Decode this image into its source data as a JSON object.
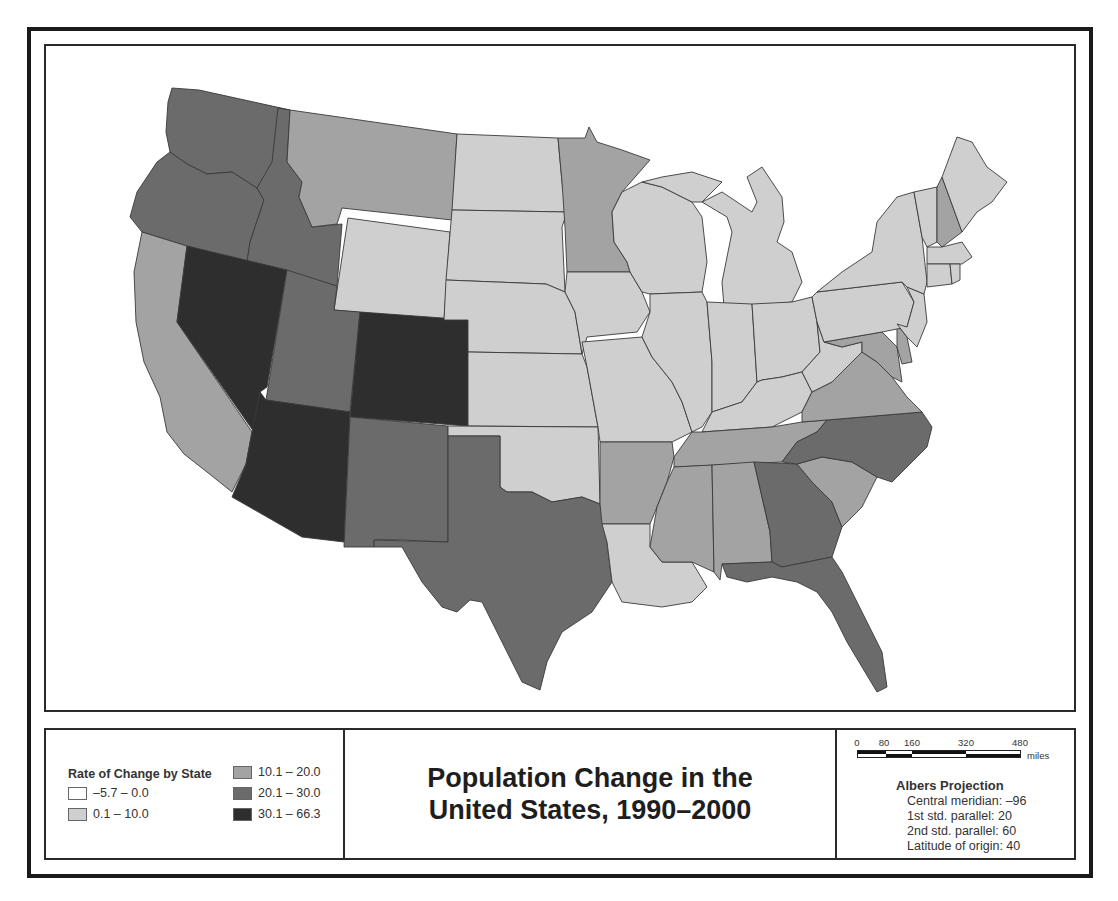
{
  "map": {
    "title_line1": "Population Change in the",
    "title_line2": "United States, 1990–2000",
    "class_colors": {
      "c1": "#ffffff",
      "c2": "#cfcfcf",
      "c3": "#a3a3a3",
      "c4": "#6b6b6b",
      "c5": "#2e2e2e"
    },
    "border_color": "#3a3a3a",
    "states": {
      "WA": "c4",
      "OR": "c4",
      "ID": "c4",
      "MT": "c3",
      "WY": "c2",
      "CA": "c3",
      "NV": "c5",
      "UT": "c4",
      "CO": "c5",
      "AZ": "c5",
      "NM": "c4",
      "TX": "c4",
      "ND": "c2",
      "SD": "c2",
      "NE": "c2",
      "KS": "c2",
      "OK": "c2",
      "MN": "c3",
      "IA": "c2",
      "MO": "c2",
      "AR": "c3",
      "LA": "c2",
      "WI": "c2",
      "IL": "c2",
      "MI": "c2",
      "IN": "c2",
      "OH": "c2",
      "KY": "c2",
      "TN": "c3",
      "MS": "c3",
      "AL": "c3",
      "GA": "c4",
      "FL": "c4",
      "SC": "c3",
      "NC": "c4",
      "VA": "c3",
      "WV": "c2",
      "MD": "c3",
      "DE": "c3",
      "PA": "c2",
      "NJ": "c2",
      "NY": "c2",
      "VT": "c2",
      "NH": "c3",
      "ME": "c2",
      "MA": "c2",
      "CT": "c2",
      "RI": "c2"
    }
  },
  "legend": {
    "title": "Rate of Change by State",
    "items": [
      {
        "label": "–5.7 – 0.0",
        "color": "#ffffff"
      },
      {
        "label": "0.1 – 10.0",
        "color": "#cfcfcf"
      },
      {
        "label": "10.1 – 20.0",
        "color": "#a3a3a3"
      },
      {
        "label": "20.1 – 30.0",
        "color": "#6b6b6b"
      },
      {
        "label": "30.1 – 66.3",
        "color": "#2e2e2e"
      }
    ]
  },
  "scale": {
    "ticks": [
      "0",
      "80",
      "160",
      "320",
      "480"
    ],
    "unit": "miles"
  },
  "projection": {
    "title": "Albers Projection",
    "lines": [
      "Central meridian: –96",
      "1st std. parallel: 20",
      "2nd std. parallel: 60",
      "Latitude of origin: 40"
    ]
  }
}
